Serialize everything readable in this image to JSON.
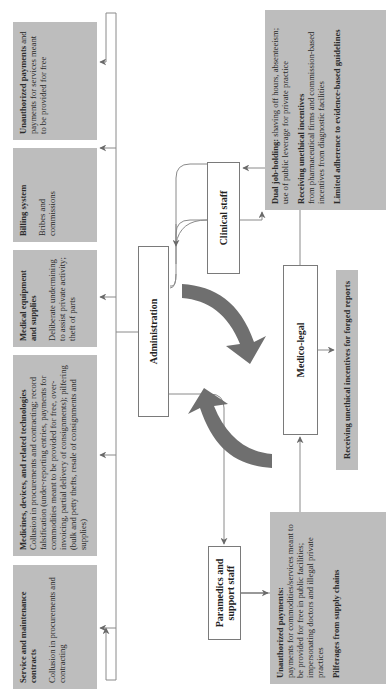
{
  "diagram": {
    "orientation": "rotated 90deg counter-clockwise",
    "colors": {
      "box_fill": "#bdbdbd",
      "line": "#7a7a7a",
      "big_arrow": "#6f6f6f",
      "node_border": "#7a7a7a"
    },
    "top_boxes": [
      {
        "title": "Service and maintenance contracts",
        "body": "Collusion in procurements and contracting"
      },
      {
        "title": "Medicines, devices, and related technologies",
        "body": "Collusion in procurements and contracting; record falsification (under-reporting entries, payments for commodities meant to be provided for free, over-invoicing, partial delivery of consignments); pilfering (bulk and petty thefts, resale of consignments and supplies)"
      },
      {
        "title": "Medical equipment and supplies",
        "body": "Deliberate undermining to assist private activity; theft of parts"
      },
      {
        "title": "Billing system",
        "body": "Bribes and commissions"
      },
      {
        "title": "Unauthorized payments",
        "body": "and payments for services meant to be provided for free"
      }
    ],
    "nodes": {
      "administration": "Administration",
      "clinical_staff": "Clinical staff",
      "paramedics": "Paramedics and support staff",
      "medico_legal": "Medico-legal"
    },
    "bottom_boxes": {
      "paramedics_box": {
        "item1_title": "Unauthorized payments:",
        "item1_body": "payments for commodities/services meant to be provided for free in public facilities; impersonating doctors and illegal private practices",
        "item2_title": "Pilferages from supply chains"
      },
      "medico_legal_box": {
        "item1_title": "Receiving unethical incentives for forged reports"
      },
      "clinical_box": {
        "item1_title": "Dual job-holding:",
        "item1_body": "shaving off hours, absenteeism; use of public leverage for private practice",
        "item2_title": "Receiving unethical incentives",
        "item2_body": "from pharmaceutical firms and commission-based incentives from diagnostic facilities",
        "item3_title": "Limited adherence to evidence-based guidelines"
      }
    }
  }
}
